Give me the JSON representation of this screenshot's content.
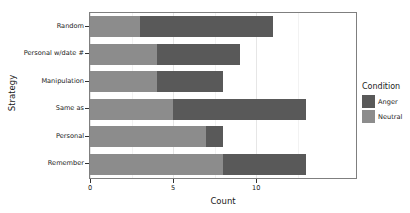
{
  "chart_data": {
    "type": "bar",
    "orientation": "horizontal",
    "stacked": true,
    "title": "",
    "xlabel": "Count",
    "ylabel": "Strategy",
    "categories": [
      "Random",
      "Personal w/date #",
      "Manipulation",
      "Same as",
      "Personal",
      "Remember"
    ],
    "series": [
      {
        "name": "Neutral",
        "color": "#8c8c8c",
        "values": [
          3,
          4,
          4,
          5,
          7,
          8
        ]
      },
      {
        "name": "Anger",
        "color": "#595959",
        "values": [
          8,
          5,
          4,
          8,
          1,
          5
        ]
      }
    ],
    "totals": [
      11,
      9,
      8,
      13,
      8,
      13
    ],
    "xlim": [
      0,
      16
    ],
    "xticks": [
      0,
      5,
      10
    ],
    "xtick_labels": [
      "0",
      "5",
      "10"
    ],
    "grid": true,
    "legend": {
      "title": "Condition",
      "position": "right",
      "entries": [
        {
          "label": "Anger",
          "color": "#595959"
        },
        {
          "label": "Neutral",
          "color": "#8c8c8c"
        }
      ]
    }
  }
}
